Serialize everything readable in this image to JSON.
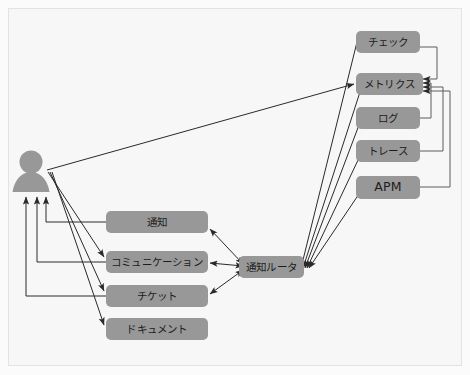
{
  "diagram": {
    "background_color": "#f7f7f7",
    "node_fill": "#989898",
    "node_text_color": "#1c1c1c",
    "edge_color": "#2a2a2a",
    "actor": {
      "name": "user-actor",
      "shape": "pawn"
    },
    "observability_nodes": [
      {
        "id": "check",
        "label": "チェック",
        "script": "jp"
      },
      {
        "id": "metrics",
        "label": "メトリクス",
        "script": "jp"
      },
      {
        "id": "log",
        "label": "ログ",
        "script": "jp"
      },
      {
        "id": "trace",
        "label": "トレース",
        "script": "jp"
      },
      {
        "id": "apm",
        "label": "APM",
        "script": "latin"
      }
    ],
    "channel_nodes": [
      {
        "id": "notification",
        "label": "通知",
        "script": "jp"
      },
      {
        "id": "communication",
        "label": "コミュニケーション",
        "script": "jp"
      },
      {
        "id": "ticket",
        "label": "チケット",
        "script": "jp"
      },
      {
        "id": "document",
        "label": "ドキュメント",
        "script": "jp"
      }
    ],
    "router_node": {
      "id": "router",
      "label": "通知ルータ",
      "script": "jp"
    },
    "edges": [
      {
        "from": "actor",
        "to": "metrics",
        "style": "straight-arrow"
      },
      {
        "from": "actor",
        "to": "communication",
        "style": "straight-arrow"
      },
      {
        "from": "actor",
        "to": "ticket",
        "style": "straight-arrow"
      },
      {
        "from": "actor",
        "to": "document",
        "style": "straight-arrow"
      },
      {
        "from": "notification",
        "to": "actor",
        "style": "elbow-arrow"
      },
      {
        "from": "communication",
        "to": "actor",
        "style": "elbow-arrow"
      },
      {
        "from": "ticket",
        "to": "actor",
        "style": "elbow-arrow"
      },
      {
        "from": "check",
        "to": "metrics",
        "style": "elbow-arrow"
      },
      {
        "from": "log",
        "to": "metrics",
        "style": "elbow-arrow"
      },
      {
        "from": "trace",
        "to": "metrics",
        "style": "elbow-arrow"
      },
      {
        "from": "apm",
        "to": "metrics",
        "style": "elbow-arrow"
      },
      {
        "from": "check",
        "to": "router",
        "style": "straight-arrow"
      },
      {
        "from": "metrics",
        "to": "router",
        "style": "straight-arrow"
      },
      {
        "from": "log",
        "to": "router",
        "style": "straight-arrow"
      },
      {
        "from": "trace",
        "to": "router",
        "style": "straight-arrow"
      },
      {
        "from": "apm",
        "to": "router",
        "style": "straight-arrow"
      },
      {
        "from": "router",
        "to": "notification",
        "style": "double-arrow"
      },
      {
        "from": "router",
        "to": "communication",
        "style": "double-arrow"
      },
      {
        "from": "router",
        "to": "ticket",
        "style": "double-arrow"
      }
    ]
  }
}
